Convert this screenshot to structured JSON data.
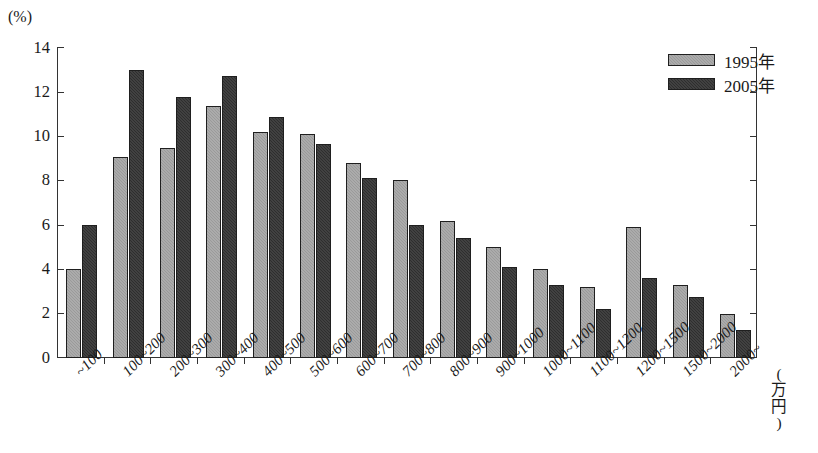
{
  "chart_data": {
    "type": "bar",
    "title": "",
    "xlabel": "(万円)",
    "ylabel": "(%)",
    "ylim": [
      0,
      14
    ],
    "ytick_values": [
      0,
      2,
      4,
      6,
      8,
      10,
      12,
      14
    ],
    "ytick_labels": [
      "0",
      "2",
      "4",
      "6",
      "8",
      "10",
      "12",
      "14"
    ],
    "grid": false,
    "legend_position": "top-right",
    "categories": [
      "~100",
      "100~200",
      "200~300",
      "300~400",
      "400~500",
      "500~600",
      "600~700",
      "700~800",
      "800~900",
      "900~1000",
      "1000~1100",
      "1100~1200",
      "1200~1500",
      "1500~2000",
      "2000~"
    ],
    "series": [
      {
        "name": "1995年",
        "color": "#9a9a9a",
        "values": [
          4.0,
          9.1,
          9.5,
          11.4,
          10.2,
          10.1,
          8.8,
          8.05,
          6.2,
          5.0,
          4.0,
          3.2,
          5.9,
          3.3,
          2.0
        ]
      },
      {
        "name": "2005年",
        "color": "#2e2e2e",
        "values": [
          6.0,
          13.0,
          11.8,
          12.75,
          10.9,
          9.65,
          8.15,
          6.0,
          5.4,
          4.1,
          3.3,
          2.2,
          3.6,
          2.75,
          1.25
        ]
      }
    ]
  }
}
